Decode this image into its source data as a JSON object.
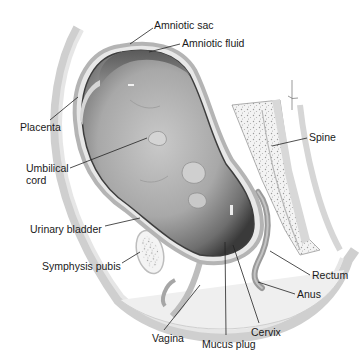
{
  "diagram": {
    "labels": {
      "amniotic_sac": "Amniotic sac",
      "amniotic_fluid": "Amniotic fluid",
      "placenta": "Placenta",
      "umbilical_cord_1": "Umbilical",
      "umbilical_cord_2": "cord",
      "spine": "Spine",
      "urinary_bladder": "Urinary bladder",
      "symphysis_pubis": "Symphysis pubis",
      "rectum": "Rectum",
      "anus": "Anus",
      "vagina": "Vagina",
      "mucus_plug": "Mucus plug",
      "cervix": "Cervix"
    }
  }
}
